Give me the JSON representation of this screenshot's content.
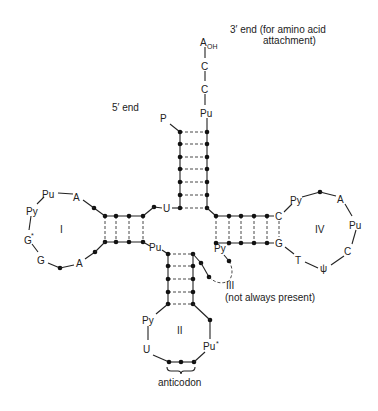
{
  "diagram": {
    "type": "tRNA cloverleaf secondary structure",
    "annotations": {
      "three_prime_end": "3′ end (for amino acid",
      "three_prime_end_line2": "attachment)",
      "five_prime_end": "5′ end",
      "variable_loop_note": "(not always present)",
      "anticodon": "anticodon"
    },
    "acceptor_arm": {
      "terminal": [
        "A",
        "C",
        "C",
        "Pu"
      ],
      "terminal_subscript": "OH",
      "five_prime_label": "P",
      "base_pairs": 7
    },
    "loops": {
      "I": {
        "label": "I",
        "bases": [
          "Pu",
          "A",
          "Py",
          "G",
          "*",
          "G",
          "A"
        ],
        "stem_pairs": 4
      },
      "II": {
        "label": "II",
        "bases": [
          "Py",
          "U",
          "Pu",
          "*"
        ],
        "stem_pairs": 5
      },
      "III": {
        "label": "III",
        "bases": [
          "Py",
          "*"
        ]
      },
      "IV": {
        "label": "IV",
        "bases": [
          "Py",
          "A",
          "Pu",
          "C",
          "ψ",
          "T",
          "C",
          "G"
        ],
        "stem_pairs": 5
      }
    },
    "junction_labels": {
      "u": "U",
      "pu": "Pu"
    }
  }
}
